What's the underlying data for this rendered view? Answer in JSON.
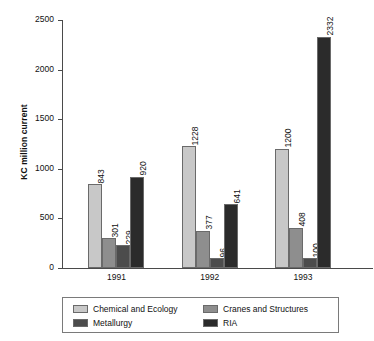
{
  "chart_data": {
    "type": "bar",
    "title": "",
    "subtitle": "",
    "xlabel": "",
    "ylabel": "KC million current",
    "categories": [
      "1991",
      "1992",
      "1993"
    ],
    "ylim": [
      0,
      2500
    ],
    "yticks": [
      0,
      500,
      1000,
      1500,
      2000,
      2500
    ],
    "ytick_labels": [
      "0",
      "500",
      "1000",
      "1500",
      "2000",
      "2500"
    ],
    "grid": false,
    "legend_position": "bottom",
    "value_labels_rotated": true,
    "series": [
      {
        "name": "Chemical and Ecology",
        "color": "#c8c8c8",
        "values": [
          843,
          1228,
          1200
        ],
        "labels": [
          "843",
          "1228",
          "1200"
        ]
      },
      {
        "name": "Cranes and Structures",
        "color": "#8e8e8e",
        "values": [
          301,
          377,
          408
        ],
        "labels": [
          "301",
          "377",
          "408"
        ]
      },
      {
        "name": "Metallurgy",
        "color": "#4c4c4c",
        "values": [
          229,
          96,
          100
        ],
        "labels": [
          "229",
          "96",
          "100"
        ]
      },
      {
        "name": "RIA",
        "color": "#2b2b2b",
        "values": [
          920,
          641,
          2332
        ],
        "labels": [
          "920",
          "641",
          "2332"
        ]
      }
    ]
  }
}
